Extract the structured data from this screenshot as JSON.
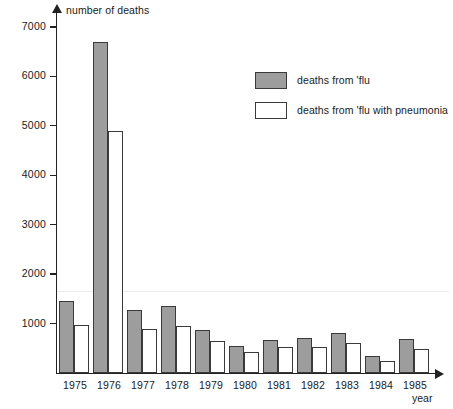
{
  "chart_data": {
    "type": "bar",
    "title": "",
    "xlabel": "year",
    "ylabel": "number of deaths",
    "categories": [
      "1975",
      "1976",
      "1977",
      "1978",
      "1979",
      "1980",
      "1981",
      "1982",
      "1983",
      "1984",
      "1985"
    ],
    "series": [
      {
        "name": "deaths from 'flu",
        "color": "#9d9d9d",
        "values": [
          1460,
          6700,
          1280,
          1350,
          870,
          540,
          660,
          700,
          810,
          350,
          680
        ]
      },
      {
        "name": "deaths from 'flu with pneumonia",
        "color": "#ffffff",
        "values": [
          980,
          4900,
          900,
          960,
          640,
          420,
          520,
          520,
          610,
          250,
          480
        ]
      }
    ],
    "ylim": [
      0,
      7400
    ],
    "yticks": [
      1000,
      2000,
      3000,
      4000,
      5000,
      6000,
      7000
    ],
    "ytick_labels": [
      "1000",
      "2000",
      "3000",
      "4000",
      "5000",
      "6000",
      "7000"
    ],
    "grid": false,
    "legend_position": "upper-right"
  },
  "axis": {
    "y_title": "number of deaths",
    "x_title": "year"
  },
  "legend": {
    "items": [
      {
        "label": "deaths from 'flu",
        "style": "filled"
      },
      {
        "label": "deaths from 'flu with pneumonia",
        "style": "hollow"
      }
    ]
  }
}
